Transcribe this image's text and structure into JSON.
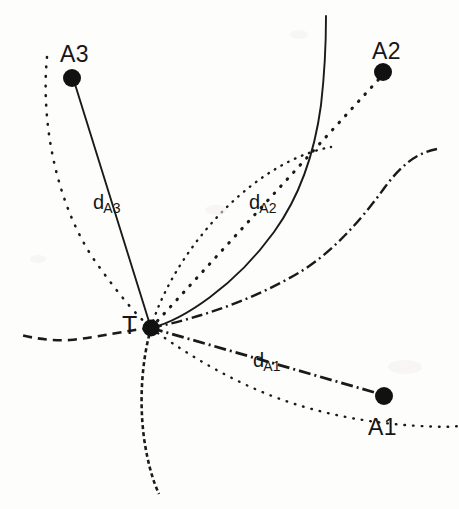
{
  "figure": {
    "background_color": "#fdfdfc",
    "ink_color": "#161616"
  },
  "nodes": [
    {
      "id": "A3",
      "label": "A3",
      "x": 72,
      "y": 78,
      "label_x": 60,
      "label_y": 43,
      "radius": 9
    },
    {
      "id": "A2",
      "label": "A2",
      "x": 383,
      "y": 72,
      "label_x": 372,
      "label_y": 40,
      "radius": 9
    },
    {
      "id": "A1",
      "label": "A1",
      "x": 384,
      "y": 396,
      "label_x": 368,
      "label_y": 416,
      "radius": 9
    },
    {
      "id": "T",
      "label": "T",
      "x": 151,
      "y": 328,
      "label_x": 122,
      "label_y": 313,
      "radius": 8
    }
  ],
  "distance_labels": [
    {
      "id": "dA3",
      "main": "d",
      "sub": "A3",
      "x": 93,
      "y": 192
    },
    {
      "id": "dA2",
      "main": "d",
      "sub": "A2",
      "x": 249,
      "y": 192
    },
    {
      "id": "dA1",
      "main": "d",
      "sub": "A1",
      "x": 253,
      "y": 350
    }
  ],
  "connectors": [
    {
      "id": "T-A3",
      "style": "solid",
      "from": "T",
      "to": "A3"
    },
    {
      "id": "T-A2",
      "style": "dotted",
      "from": "T",
      "to": "A2"
    },
    {
      "id": "T-A1",
      "style": "dash-dot",
      "from": "T",
      "to": "A1"
    }
  ],
  "range_circles": [
    {
      "id": "arc-A3-left",
      "style": "dotted",
      "note": "range arc around A3 passing through T, left side"
    },
    {
      "id": "arc-A3-bottom",
      "style": "dashed",
      "note": "range arc around A3 passing through T, lower side"
    },
    {
      "id": "arc-A2-lens",
      "style": "dotted",
      "note": "range arc around A2 passing through T, upper-left of lens"
    },
    {
      "id": "arc-A2-right",
      "style": "solid",
      "note": "range arc around A2 passing through T, right side"
    },
    {
      "id": "arc-A1-left",
      "style": "dashed",
      "note": "range arc around A1 passing through T, to the left"
    },
    {
      "id": "arc-A1-right",
      "style": "dash-dot",
      "note": "range arc around A1 passing through T, to the right"
    },
    {
      "id": "arc-A1-lower",
      "style": "dotted",
      "note": "range arc around A1 passing through T, lower right"
    }
  ]
}
